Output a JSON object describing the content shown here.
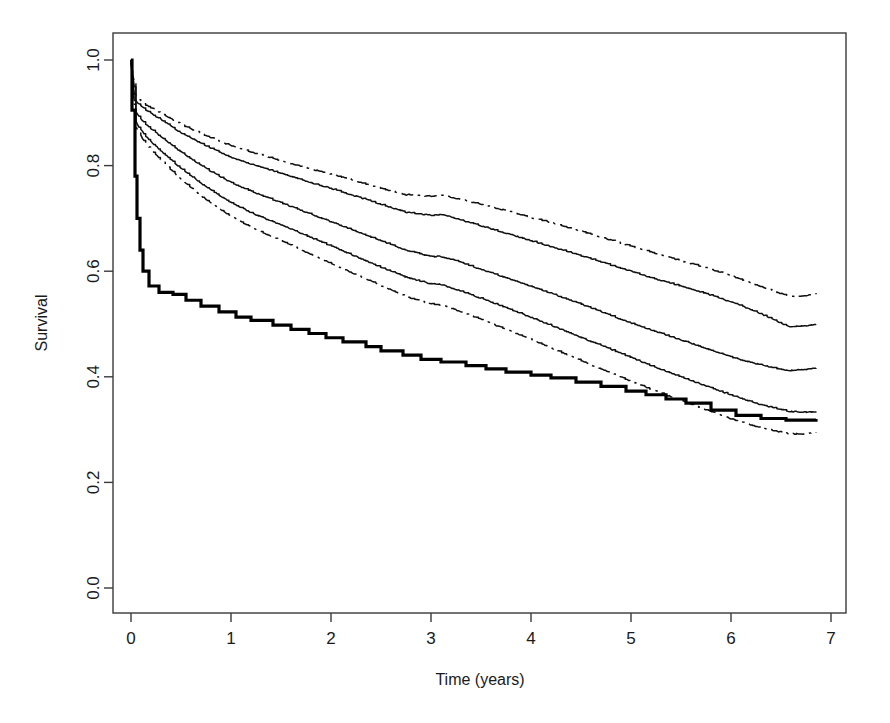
{
  "chart_data": {
    "type": "line",
    "title": "",
    "xlabel": "Time (years)",
    "ylabel": "Survival",
    "xlim": [
      -0.18,
      7.1
    ],
    "ylim": [
      0.0,
      1.04
    ],
    "xticks": [
      "0",
      "1",
      "2",
      "3",
      "4",
      "5",
      "6",
      "7"
    ],
    "xtick_values": [
      0,
      1,
      2,
      3,
      4,
      5,
      6,
      7
    ],
    "yticks": [
      "0.0",
      "0.2",
      "0.4",
      "0.6",
      "0.8",
      "1.0"
    ],
    "ytick_values": [
      0.0,
      0.2,
      0.4,
      0.6,
      0.8,
      1.0
    ],
    "grid": false,
    "legend": "none",
    "box": true,
    "series": [
      {
        "name": "curve-1-upper-band",
        "style": "dash-dot",
        "linewidth": 1.5,
        "x": [
          0,
          0.05,
          0.15,
          0.3,
          0.5,
          0.75,
          1.0,
          1.25,
          1.5,
          1.75,
          2.0,
          2.25,
          2.5,
          2.75,
          3.0,
          3.1,
          3.25,
          3.5,
          3.75,
          4.0,
          4.25,
          4.5,
          4.75,
          5.0,
          5.25,
          5.5,
          5.75,
          6.0,
          6.25,
          6.5,
          6.6,
          6.75,
          6.85
        ],
        "y": [
          1.0,
          0.93,
          0.915,
          0.9,
          0.878,
          0.857,
          0.838,
          0.823,
          0.81,
          0.796,
          0.784,
          0.771,
          0.757,
          0.745,
          0.742,
          0.744,
          0.738,
          0.727,
          0.715,
          0.702,
          0.69,
          0.676,
          0.662,
          0.648,
          0.634,
          0.62,
          0.607,
          0.592,
          0.574,
          0.558,
          0.552,
          0.554,
          0.558
        ]
      },
      {
        "name": "curve-2",
        "style": "solid",
        "linewidth": 1.5,
        "x": [
          0,
          0.05,
          0.15,
          0.3,
          0.5,
          0.75,
          1.0,
          1.25,
          1.5,
          1.75,
          2.0,
          2.25,
          2.5,
          2.75,
          3.0,
          3.1,
          3.25,
          3.5,
          3.75,
          4.0,
          4.25,
          4.5,
          4.75,
          5.0,
          5.25,
          5.5,
          5.75,
          6.0,
          6.25,
          6.5,
          6.6,
          6.75,
          6.85
        ],
        "y": [
          1.0,
          0.922,
          0.905,
          0.888,
          0.862,
          0.838,
          0.816,
          0.8,
          0.786,
          0.771,
          0.757,
          0.742,
          0.727,
          0.712,
          0.706,
          0.708,
          0.7,
          0.686,
          0.672,
          0.658,
          0.644,
          0.63,
          0.615,
          0.6,
          0.585,
          0.572,
          0.558,
          0.542,
          0.524,
          0.502,
          0.494,
          0.497,
          0.5
        ]
      },
      {
        "name": "curve-3-median",
        "style": "solid",
        "linewidth": 1.5,
        "x": [
          0,
          0.05,
          0.15,
          0.3,
          0.5,
          0.75,
          1.0,
          1.25,
          1.5,
          1.75,
          2.0,
          2.25,
          2.5,
          2.75,
          3.0,
          3.1,
          3.25,
          3.5,
          3.75,
          4.0,
          4.25,
          4.5,
          4.75,
          5.0,
          5.25,
          5.5,
          5.75,
          6.0,
          6.25,
          6.5,
          6.6,
          6.75,
          6.85
        ],
        "y": [
          1.0,
          0.9,
          0.878,
          0.855,
          0.826,
          0.795,
          0.768,
          0.748,
          0.73,
          0.712,
          0.694,
          0.676,
          0.658,
          0.64,
          0.628,
          0.628,
          0.62,
          0.604,
          0.588,
          0.572,
          0.555,
          0.538,
          0.52,
          0.502,
          0.486,
          0.47,
          0.454,
          0.438,
          0.425,
          0.414,
          0.412,
          0.414,
          0.417
        ]
      },
      {
        "name": "curve-4",
        "style": "solid",
        "linewidth": 1.5,
        "x": [
          0,
          0.05,
          0.15,
          0.3,
          0.5,
          0.75,
          1.0,
          1.25,
          1.5,
          1.75,
          2.0,
          2.25,
          2.5,
          2.75,
          3.0,
          3.1,
          3.25,
          3.5,
          3.75,
          4.0,
          4.25,
          4.5,
          4.75,
          5.0,
          5.25,
          5.5,
          5.75,
          6.0,
          6.25,
          6.5,
          6.6,
          6.75,
          6.85
        ],
        "y": [
          1.0,
          0.882,
          0.855,
          0.828,
          0.795,
          0.76,
          0.73,
          0.707,
          0.688,
          0.668,
          0.648,
          0.628,
          0.608,
          0.589,
          0.576,
          0.575,
          0.566,
          0.549,
          0.531,
          0.513,
          0.494,
          0.475,
          0.456,
          0.437,
          0.418,
          0.4,
          0.383,
          0.366,
          0.35,
          0.338,
          0.334,
          0.333,
          0.334
        ]
      },
      {
        "name": "curve-5-lower-band",
        "style": "dash-dot",
        "linewidth": 1.5,
        "x": [
          0,
          0.05,
          0.15,
          0.3,
          0.5,
          0.75,
          1.0,
          1.25,
          1.5,
          1.75,
          2.0,
          2.25,
          2.5,
          2.75,
          3.0,
          3.1,
          3.25,
          3.5,
          3.75,
          4.0,
          4.25,
          4.5,
          4.75,
          5.0,
          5.25,
          5.5,
          5.75,
          6.0,
          6.25,
          6.5,
          6.6,
          6.75,
          6.85
        ],
        "y": [
          1.0,
          0.872,
          0.841,
          0.811,
          0.774,
          0.736,
          0.704,
          0.679,
          0.658,
          0.636,
          0.615,
          0.594,
          0.573,
          0.552,
          0.538,
          0.536,
          0.527,
          0.509,
          0.49,
          0.471,
          0.451,
          0.431,
          0.411,
          0.392,
          0.373,
          0.355,
          0.338,
          0.321,
          0.306,
          0.295,
          0.292,
          0.292,
          0.294
        ]
      },
      {
        "name": "observed-kaplan-meier",
        "style": "step-thick",
        "linewidth": 3.2,
        "x": [
          0,
          0.01,
          0.04,
          0.06,
          0.09,
          0.12,
          0.18,
          0.28,
          0.42,
          0.55,
          0.7,
          0.88,
          1.05,
          1.2,
          1.42,
          1.6,
          1.78,
          1.95,
          2.12,
          2.35,
          2.5,
          2.72,
          2.9,
          3.1,
          3.35,
          3.55,
          3.75,
          4.0,
          4.2,
          4.45,
          4.7,
          4.95,
          5.15,
          5.35,
          5.55,
          5.8,
          6.05,
          6.3,
          6.55,
          6.85
        ],
        "y": [
          1.0,
          0.905,
          0.78,
          0.7,
          0.64,
          0.6,
          0.572,
          0.56,
          0.556,
          0.545,
          0.534,
          0.523,
          0.513,
          0.507,
          0.498,
          0.49,
          0.482,
          0.474,
          0.466,
          0.457,
          0.449,
          0.441,
          0.433,
          0.428,
          0.421,
          0.415,
          0.409,
          0.403,
          0.398,
          0.39,
          0.382,
          0.373,
          0.366,
          0.358,
          0.35,
          0.337,
          0.327,
          0.321,
          0.318,
          0.32
        ]
      }
    ]
  },
  "axes": {
    "y_title": "Survival",
    "x_title": "Time (years)"
  },
  "colors": {
    "curve": "#101010",
    "thick_curve": "#000000",
    "axis": "#3a3a3a",
    "background": "#ffffff"
  }
}
